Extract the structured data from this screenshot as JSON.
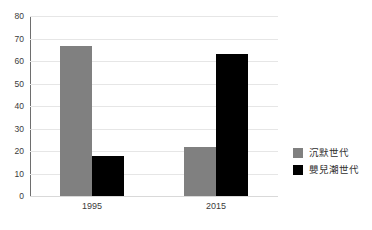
{
  "chart_data": {
    "type": "bar",
    "title": "",
    "subtitle": "",
    "xlabel": "",
    "ylabel": "",
    "categories": [
      "1995",
      "2015"
    ],
    "series": [
      {
        "name": "沉默世代",
        "color": "#808080",
        "values": [
          66.5,
          22
        ]
      },
      {
        "name": "嬰兒潮世代",
        "color": "#000000",
        "values": [
          18,
          63
        ]
      }
    ],
    "ylim": [
      0,
      80
    ],
    "ytick_step": 10,
    "yticks": [
      "80",
      "70",
      "60",
      "50",
      "40",
      "30",
      "20",
      "10",
      "0"
    ],
    "grid": true,
    "grid_axis": "y",
    "legend_position": "right",
    "orientation": "vertical",
    "grouping": "grouped"
  },
  "colors": {
    "background": "#ffffff",
    "gridline": "#e6e6e6",
    "axis_line": "#6e6e6e",
    "text": "#3b3b3b",
    "series_silent": "#808080",
    "series_boomer": "#000000"
  }
}
